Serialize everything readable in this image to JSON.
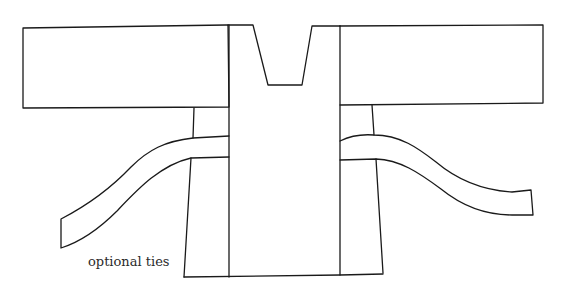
{
  "diagram": {
    "type": "garment-pattern",
    "stroke_color": "#1a1a1a",
    "background": "#ffffff",
    "parts": [
      {
        "id": "left-sleeve",
        "shape": "rectangle"
      },
      {
        "id": "right-sleeve",
        "shape": "rectangle"
      },
      {
        "id": "center-body",
        "shape": "rectangle with neckline cut"
      },
      {
        "id": "neckline",
        "shape": "trapezoid cut"
      },
      {
        "id": "left-side-panel",
        "shape": "tapered panel"
      },
      {
        "id": "right-side-panel",
        "shape": "tapered panel"
      },
      {
        "id": "left-tie",
        "shape": "curved strip"
      },
      {
        "id": "right-tie",
        "shape": "curved strip"
      }
    ],
    "labels": {
      "ties_note": "optional ties"
    }
  }
}
